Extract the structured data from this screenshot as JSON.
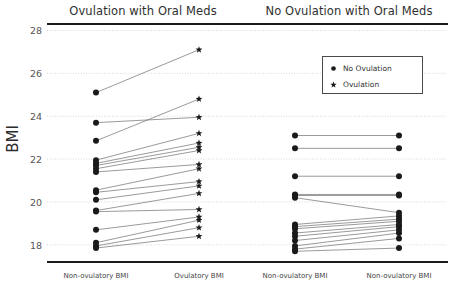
{
  "figure": {
    "ylabel": "BMI",
    "panels": [
      {
        "title": "Ovulation with Oral Meds"
      },
      {
        "title": "No Ovulation with Oral Meds"
      }
    ],
    "legend": {
      "entries": [
        {
          "label": "No Ovulation",
          "marker": "circle-marker-icon"
        },
        {
          "label": "Ovulation",
          "marker": "star-marker-icon"
        }
      ]
    }
  },
  "chart_data": {
    "type": "line",
    "chart_kind": "paired-slope-parallel-coordinates",
    "title": "",
    "xlabel": "",
    "ylabel": "BMI",
    "ylim": [
      17.2,
      28.3
    ],
    "yticks": [
      18,
      20,
      22,
      24,
      26,
      28
    ],
    "ytick_labels": [
      "18",
      "20",
      "22",
      "24",
      "26",
      "28"
    ],
    "grid": true,
    "grid_axis": "y",
    "grid_style": "dotted",
    "legend_position": "upper right",
    "panels": [
      {
        "name": "Ovulation with Oral Meds",
        "categories": [
          "Non-ovulatory BMI",
          "Ovulatory BMI"
        ],
        "left_marker": "circle",
        "right_marker": "star",
        "pairs": [
          {
            "non_ovulatory": 25.1,
            "ovulatory": 27.1
          },
          {
            "non_ovulatory": 23.7,
            "ovulatory": 23.95
          },
          {
            "non_ovulatory": 22.85,
            "ovulatory": 24.8
          },
          {
            "non_ovulatory": 21.95,
            "ovulatory": 23.2
          },
          {
            "non_ovulatory": 21.8,
            "ovulatory": 22.75
          },
          {
            "non_ovulatory": 21.7,
            "ovulatory": 22.55
          },
          {
            "non_ovulatory": 21.55,
            "ovulatory": 22.4
          },
          {
            "non_ovulatory": 21.4,
            "ovulatory": 21.75
          },
          {
            "non_ovulatory": 20.55,
            "ovulatory": 21.55
          },
          {
            "non_ovulatory": 20.45,
            "ovulatory": 20.95
          },
          {
            "non_ovulatory": 20.1,
            "ovulatory": 20.75
          },
          {
            "non_ovulatory": 19.6,
            "ovulatory": 20.4
          },
          {
            "non_ovulatory": 19.55,
            "ovulatory": 19.65
          },
          {
            "non_ovulatory": 18.7,
            "ovulatory": 19.3
          },
          {
            "non_ovulatory": 18.1,
            "ovulatory": 19.15
          },
          {
            "non_ovulatory": 17.95,
            "ovulatory": 18.8
          },
          {
            "non_ovulatory": 17.85,
            "ovulatory": 18.4
          }
        ]
      },
      {
        "name": "No Ovulation with Oral Meds",
        "categories": [
          "Non-ovulatory BMI",
          "Non-ovulatory BMI"
        ],
        "left_marker": "circle",
        "right_marker": "circle",
        "pairs": [
          {
            "non_ovulatory_a": 23.1,
            "non_ovulatory_b": 23.1
          },
          {
            "non_ovulatory_a": 22.5,
            "non_ovulatory_b": 22.5
          },
          {
            "non_ovulatory_a": 21.2,
            "non_ovulatory_b": 21.2
          },
          {
            "non_ovulatory_a": 20.35,
            "non_ovulatory_b": 20.35
          },
          {
            "non_ovulatory_a": 20.3,
            "non_ovulatory_b": 20.3
          },
          {
            "non_ovulatory_a": 20.2,
            "non_ovulatory_b": 19.5
          },
          {
            "non_ovulatory_a": 18.95,
            "non_ovulatory_b": 19.35
          },
          {
            "non_ovulatory_a": 18.85,
            "non_ovulatory_b": 19.2
          },
          {
            "non_ovulatory_a": 18.75,
            "non_ovulatory_b": 19.1
          },
          {
            "non_ovulatory_a": 18.55,
            "non_ovulatory_b": 18.95
          },
          {
            "non_ovulatory_a": 18.4,
            "non_ovulatory_b": 18.85
          },
          {
            "non_ovulatory_a": 18.2,
            "non_ovulatory_b": 18.7
          },
          {
            "non_ovulatory_a": 17.95,
            "non_ovulatory_b": 18.55
          },
          {
            "non_ovulatory_a": 17.8,
            "non_ovulatory_b": 18.3
          },
          {
            "non_ovulatory_a": 17.7,
            "non_ovulatory_b": 17.85
          }
        ]
      }
    ],
    "xtick_positions": [
      {
        "label": "Non-ovulatory BMI",
        "panel": 0
      },
      {
        "label": "Ovulatory BMI",
        "panel": 0
      },
      {
        "label": "Non-ovulatory BMI",
        "panel": 1
      },
      {
        "label": "Non-ovulatory BMI",
        "panel": 1
      }
    ],
    "colors": {
      "line": "#6e6e6e",
      "marker": "#1a1a1a",
      "grid": "#cfcfcf",
      "frame": "#1a1a1a",
      "text": "#3b3b3b"
    }
  }
}
